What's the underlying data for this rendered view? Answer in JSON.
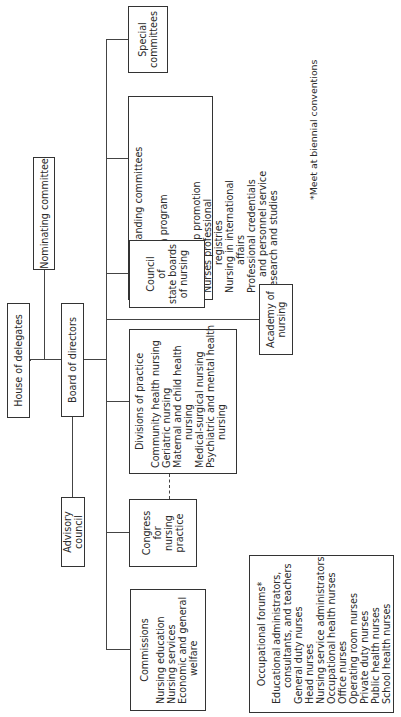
{
  "chart_data": {
    "type": "org-chart",
    "title": "",
    "nodes": [
      {
        "id": "house_of_delegates",
        "label": "House of delegates"
      },
      {
        "id": "board_of_directors",
        "label": "Board of directors",
        "parent": "house_of_delegates"
      },
      {
        "id": "nominating_committee",
        "label": "Nominating committee",
        "parent": "house_of_delegates"
      },
      {
        "id": "advisory_council",
        "label": "Advisory council",
        "parent": "board_of_directors"
      },
      {
        "id": "special_committees",
        "label": "Special committees",
        "parent": "board_of_directors"
      },
      {
        "id": "standing_committees",
        "label": "Standing committees",
        "parent": "board_of_directors"
      },
      {
        "id": "council_state_boards",
        "label": "Council of state boards of nursing",
        "parent": "board_of_directors"
      },
      {
        "id": "academy_of_nursing",
        "label": "Academy of nursing",
        "parent": "board_of_directors"
      },
      {
        "id": "divisions_of_practice",
        "label": "Divisions of practice",
        "parent": "board_of_directors"
      },
      {
        "id": "congress_nursing_practice",
        "label": "Congress for nursing practice",
        "parent": "board_of_directors",
        "dashed_link": "divisions_of_practice"
      },
      {
        "id": "commissions",
        "label": "Commissions",
        "parent": "board_of_directors"
      },
      {
        "id": "occupational_forums",
        "label": "Occupational forums*"
      }
    ]
  },
  "nodes": {
    "house": "House of delegates",
    "board": "Board of directors",
    "nominating": "Nominating committee",
    "advisory": "Advisory council",
    "special": [
      "Special",
      "committees"
    ],
    "standing": {
      "title": "Standing committees",
      "items": [
        {
          "t": "Bylaws",
          "c": 0
        },
        {
          "t": "Convention program",
          "c": 0
        },
        {
          "t": "Finance",
          "c": 0
        },
        {
          "t": "Legislation",
          "c": 0
        },
        {
          "t": "Membership promotion",
          "c": 0
        },
        {
          "t": "Nurses professional",
          "c": 0
        },
        {
          "t": "registries",
          "c": 2
        },
        {
          "t": "Nursing in international",
          "c": 0
        },
        {
          "t": "affairs",
          "c": 2
        },
        {
          "t": "Professional credentials",
          "c": 0
        },
        {
          "t": "and personnel service",
          "c": 1
        },
        {
          "t": "Research and studies",
          "c": 0
        }
      ]
    },
    "council": [
      "Council",
      "of",
      "state boards",
      "of nursing"
    ],
    "academy": [
      "Academy of",
      "nursing"
    ],
    "divisions": {
      "title": "Divisions of practice",
      "items": [
        {
          "t": "Community health nursing",
          "c": 0
        },
        {
          "t": "Geriatric nursing",
          "c": 0
        },
        {
          "t": "Maternal and child health",
          "c": 0
        },
        {
          "t": "nursing",
          "c": 2
        },
        {
          "t": "Medical-surgical nursing",
          "c": 0
        },
        {
          "t": "Psychiatric and mental health",
          "c": 0
        },
        {
          "t": "nursing",
          "c": 2
        }
      ]
    },
    "congress": [
      "Congress",
      "for",
      "nursing",
      "practice"
    ],
    "commissions": {
      "title": "Commissions",
      "items": [
        {
          "t": "Nursing education",
          "c": 0
        },
        {
          "t": "Nursing services",
          "c": 0
        },
        {
          "t": "Economic and general",
          "c": 0
        },
        {
          "t": "welfare",
          "c": 2
        }
      ]
    },
    "forums": {
      "title": "Occupational forums*",
      "items": [
        {
          "t": "Educational administrators,",
          "c": 0
        },
        {
          "t": "consultants, and teachers",
          "c": 1
        },
        {
          "t": "General duty nurses",
          "c": 0
        },
        {
          "t": "Head nurses",
          "c": 0
        },
        {
          "t": "Nursing service administrators",
          "c": 0
        },
        {
          "t": "Occupational health nurses",
          "c": 0
        },
        {
          "t": "Office nurses",
          "c": 0
        },
        {
          "t": "Operating room nurses",
          "c": 0
        },
        {
          "t": "Private duty nurses",
          "c": 0
        },
        {
          "t": "Public health nurses",
          "c": 0
        },
        {
          "t": "School health nurses",
          "c": 0
        }
      ]
    }
  },
  "footnote": "*Meet at biennial conventions"
}
